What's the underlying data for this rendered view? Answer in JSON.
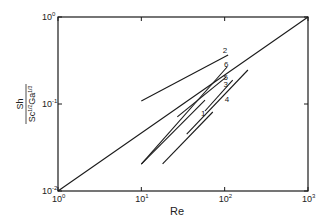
{
  "chart_data": {
    "type": "line",
    "title": "",
    "xlabel": "Re",
    "ylabel": "Sh / (Sc^{1/2} Ga^{1/3})",
    "ylabel_parts": {
      "num": "Sh",
      "den_a": "Sc",
      "den_a_exp": "1/2",
      "den_b": "Ga",
      "den_b_exp": "1/3"
    },
    "xscale": "log",
    "yscale": "log",
    "xlim": [
      1,
      1000
    ],
    "ylim": [
      0.01,
      1
    ],
    "x_ticks": [
      {
        "value": 1,
        "base": "10",
        "exp": "0"
      },
      {
        "value": 10,
        "base": "10",
        "exp": "1"
      },
      {
        "value": 100,
        "base": "10",
        "exp": "2"
      },
      {
        "value": 1000,
        "base": "10",
        "exp": "3"
      }
    ],
    "y_ticks": [
      {
        "value": 0.01,
        "base": "10",
        "exp": "-2"
      },
      {
        "value": 0.1,
        "base": "10",
        "exp": "-1"
      },
      {
        "value": 1,
        "base": "10",
        "exp": "0"
      }
    ],
    "grid": false,
    "legend": "none (curves labeled inline)",
    "series": [
      {
        "name": "reference",
        "label": "",
        "x": [
          1,
          1000
        ],
        "y": [
          0.01,
          1.0
        ]
      },
      {
        "name": "curve-1",
        "label": "1",
        "x": [
          10,
          58
        ],
        "y": [
          0.0204,
          0.111
        ],
        "label_pos": [
          52,
          0.072
        ]
      },
      {
        "name": "curve-1-lower",
        "label": "",
        "x": [
          18,
          72
        ],
        "y": [
          0.0205,
          0.081
        ]
      },
      {
        "name": "curve-2",
        "label": "2",
        "x": [
          10,
          110
        ],
        "y": [
          0.108,
          0.366
        ],
        "label_pos": [
          95,
          0.39
        ]
      },
      {
        "name": "curve-3",
        "label": "3",
        "x": [
          58,
          125
        ],
        "y": [
          0.083,
          0.188
        ],
        "label_pos": [
          97,
          0.155
        ]
      },
      {
        "name": "curve-4",
        "label": "4",
        "x": [
          35,
          190
        ],
        "y": [
          0.045,
          0.246
        ],
        "label_pos": [
          100,
          0.105
        ]
      },
      {
        "name": "curve-5",
        "label": "5",
        "x": [
          27,
          104
        ],
        "y": [
          0.071,
          0.204
        ],
        "label_pos": [
          97,
          0.19
        ]
      },
      {
        "name": "curve-6",
        "label": "6",
        "x": [
          10,
          107
        ],
        "y": [
          0.0204,
          0.266
        ],
        "label_pos": [
          98,
          0.265
        ]
      }
    ]
  }
}
